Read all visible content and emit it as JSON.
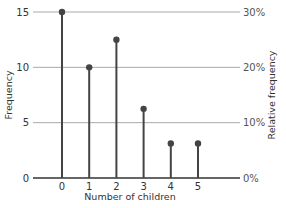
{
  "chart_data": {
    "type": "bar",
    "subtype": "stem",
    "title": "",
    "xlabel": "Number of children",
    "ylabel": "Frequency",
    "ylabel_right": "Relative frequency",
    "categories": [
      "0",
      "1",
      "2",
      "3",
      "4",
      "5"
    ],
    "values": [
      15,
      10,
      12.5,
      6.25,
      3.125,
      3.125
    ],
    "ylim": [
      0,
      15
    ],
    "yticks": [
      0,
      5,
      10,
      15
    ],
    "ytick_labels": [
      "0",
      "5",
      "10",
      "15"
    ],
    "right_ticks": [
      0,
      5,
      10,
      15
    ],
    "right_tick_labels": [
      "0%",
      "10%",
      "20%",
      "30%"
    ],
    "grid": true,
    "colors": {
      "stem": "#444444",
      "grid": "#aaaaaa",
      "axis": "#333333"
    }
  }
}
